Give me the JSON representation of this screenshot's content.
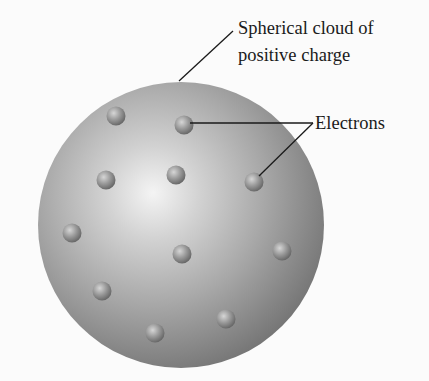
{
  "diagram": {
    "type": "thomson-plum-pudding-atom-model",
    "sphere": {
      "cx": 181,
      "cy": 225,
      "r": 143,
      "highlight": {
        "x": 153,
        "y": 193
      }
    },
    "labels": {
      "cloud_line1": "Spherical cloud of",
      "cloud_line2": "positive charge",
      "electrons": "Electrons"
    },
    "electrons": [
      {
        "x": 116,
        "y": 116
      },
      {
        "x": 184,
        "y": 125
      },
      {
        "x": 106,
        "y": 180
      },
      {
        "x": 176,
        "y": 175
      },
      {
        "x": 254,
        "y": 182
      },
      {
        "x": 72,
        "y": 233
      },
      {
        "x": 182,
        "y": 254
      },
      {
        "x": 282,
        "y": 251
      },
      {
        "x": 102,
        "y": 291
      },
      {
        "x": 155,
        "y": 333
      },
      {
        "x": 226,
        "y": 319
      }
    ],
    "leader_lines": {
      "cloud": {
        "x1": 233,
        "y1": 31,
        "x2": 179,
        "y2": 81
      },
      "electrons_a": {
        "x1": 190,
        "y1": 123,
        "x2": 313,
        "y2": 123
      },
      "electrons_b": {
        "x1": 313,
        "y1": 123,
        "x2": 259,
        "y2": 176
      }
    },
    "colors": {
      "background": "#fbfbfb",
      "sphere_light": "#f2f2f2",
      "sphere_mid": "#b4b4b4",
      "sphere_dark": "#7c7c7c",
      "electron_light": "#c9c9c9",
      "electron_dark": "#6a6a6a",
      "line": "#1a1a1a"
    }
  }
}
